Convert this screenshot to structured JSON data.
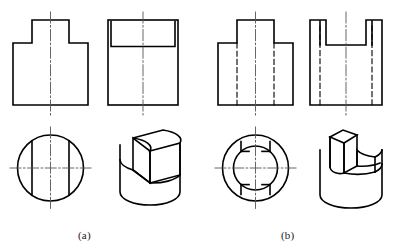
{
  "figure": {
    "title": "",
    "background_color": "#ffffff",
    "line_color": "#000000",
    "centerline_color": "#555555",
    "width": 394,
    "height": 250
  },
  "captions": {
    "a": "(a)",
    "b": "(b)"
  },
  "parts": [
    {
      "id": "a",
      "label": "(a)",
      "description": "Cylinder with a flat-sided rectangular boss on top",
      "views": [
        {
          "name": "front-view",
          "type": "orthographic",
          "hidden_lines": false,
          "outline": "stepped T-shape: wide base with narrower raised boss centered on top",
          "bounds": {
            "x": 13,
            "y": 20,
            "width": 75,
            "height": 85
          }
        },
        {
          "name": "side-view",
          "type": "orthographic",
          "hidden_lines": false,
          "outline": "rectangle with an inner rectangle at top representing boss width",
          "bounds": {
            "x": 108,
            "y": 20,
            "width": 70,
            "height": 85
          }
        },
        {
          "name": "top-view",
          "type": "orthographic",
          "hidden_lines": false,
          "outline": "circle with two vertical chord lines marking the flats of the boss",
          "bounds": {
            "x": 17,
            "y": 135,
            "width": 66,
            "height": 66
          }
        },
        {
          "name": "isometric-view",
          "type": "pictorial",
          "hidden_lines": false,
          "outline": "cylinder with a rectangular prism boss whose sides are flats",
          "bounds": {
            "x": 118,
            "y": 130,
            "width": 62,
            "height": 82
          }
        }
      ]
    },
    {
      "id": "b",
      "label": "(b)",
      "description": "Cylinder with a through slot cut across the top, leaving two raised lugs",
      "views": [
        {
          "name": "front-view",
          "type": "orthographic",
          "hidden_lines": true,
          "outline": "stepped T-shape with dashed hidden lines showing the slot walls",
          "bounds": {
            "x": 218,
            "y": 20,
            "width": 75,
            "height": 85
          }
        },
        {
          "name": "side-view",
          "type": "orthographic",
          "hidden_lines": true,
          "outline": "rectangle with two notches at top and dashed hidden lines",
          "bounds": {
            "x": 310,
            "y": 20,
            "width": 72,
            "height": 85
          }
        },
        {
          "name": "top-view",
          "type": "orthographic",
          "hidden_lines": false,
          "outline": "two concentric circles with slot openings top and bottom",
          "bounds": {
            "x": 222,
            "y": 135,
            "width": 66,
            "height": 66
          }
        },
        {
          "name": "isometric-view",
          "type": "pictorial",
          "hidden_lines": false,
          "outline": "cylinder with a wide slot milled down through the upper portion",
          "bounds": {
            "x": 318,
            "y": 130,
            "width": 64,
            "height": 82
          }
        }
      ]
    }
  ],
  "line_styles": {
    "visible": "solid",
    "hidden": "dashed",
    "center": "dash-dot"
  }
}
